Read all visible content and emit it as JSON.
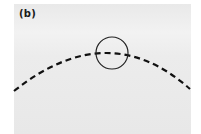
{
  "figure": {
    "panel_label": "(b)",
    "elements": [
      {
        "type": "dashed-arc",
        "description": "curved boundary",
        "color": "#111111"
      },
      {
        "type": "circle",
        "description": "circle intersecting the arc near its apex",
        "color": "#222222"
      }
    ]
  }
}
